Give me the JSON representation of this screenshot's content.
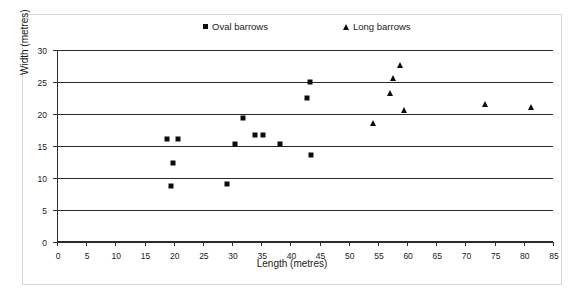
{
  "chart_data": {
    "type": "scatter",
    "title": "",
    "xlabel": "Length (metres)",
    "ylabel": "Width (metres)",
    "xlim": [
      0,
      85
    ],
    "ylim": [
      0,
      30
    ],
    "xticks": [
      0,
      5,
      10,
      15,
      20,
      25,
      30,
      35,
      40,
      45,
      50,
      55,
      60,
      65,
      70,
      75,
      80,
      85
    ],
    "yticks": [
      0,
      5,
      10,
      15,
      20,
      25,
      30
    ],
    "grid": "horizontal",
    "legend_position": "top-center",
    "marker_color": "#0d0d0d",
    "series": [
      {
        "name": "Oval barrows",
        "marker": "square",
        "points": [
          [
            18.8,
            16.1
          ],
          [
            20.8,
            16.1
          ],
          [
            19.8,
            12.3
          ],
          [
            19.6,
            8.8
          ],
          [
            29.1,
            9.1
          ],
          [
            30.5,
            15.3
          ],
          [
            31.8,
            19.3
          ],
          [
            33.9,
            16.7
          ],
          [
            35.3,
            16.7
          ],
          [
            38.3,
            15.3
          ],
          [
            42.8,
            22.5
          ],
          [
            43.3,
            25.0
          ],
          [
            43.5,
            13.6
          ]
        ]
      },
      {
        "name": "Long barrows",
        "marker": "triangle",
        "points": [
          [
            54.2,
            18.6
          ],
          [
            57.1,
            23.3
          ],
          [
            57.5,
            25.7
          ],
          [
            58.7,
            27.6
          ],
          [
            59.4,
            20.6
          ],
          [
            73.3,
            21.5
          ],
          [
            81.3,
            21.1
          ]
        ]
      }
    ]
  },
  "legend": {
    "oval_label": "Oval barrows",
    "long_label": "Long barrows"
  }
}
